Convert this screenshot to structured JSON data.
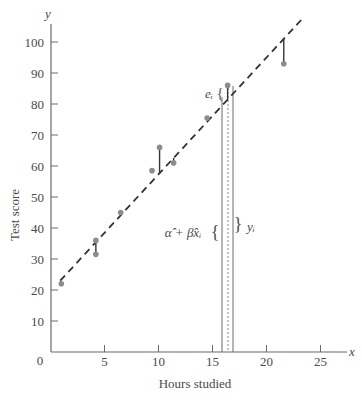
{
  "chart_data": {
    "type": "scatter",
    "title": "",
    "xlabel": "Hours studied",
    "ylabel": "Test score",
    "x_axis_letter": "x",
    "y_axis_letter": "y",
    "xlim": [
      0,
      26.5
    ],
    "ylim": [
      0,
      107
    ],
    "x_ticks": [
      0,
      5,
      10,
      15,
      20,
      25
    ],
    "y_ticks": [
      10,
      20,
      30,
      40,
      50,
      60,
      70,
      80,
      90,
      100
    ],
    "origin_label": "0",
    "grid": false,
    "legend": null,
    "points": [
      {
        "x": 1.0,
        "y": 22.0
      },
      {
        "x": 4.2,
        "y": 36.0
      },
      {
        "x": 4.2,
        "y": 31.5
      },
      {
        "x": 6.5,
        "y": 45.0
      },
      {
        "x": 9.4,
        "y": 58.5
      },
      {
        "x": 10.1,
        "y": 66.0
      },
      {
        "x": 11.4,
        "y": 61.0
      },
      {
        "x": 14.5,
        "y": 75.5
      },
      {
        "x": 16.4,
        "y": 86.0
      },
      {
        "x": 21.6,
        "y": 93.0
      }
    ],
    "regression_line": {
      "style": "dashed",
      "intercept": 19.6,
      "slope": 3.77,
      "x_start": 0.9,
      "x_end": 23.4
    },
    "residuals": [
      {
        "x": 4.2,
        "y_point": 31.5,
        "y_fit": 35.4
      },
      {
        "x": 10.1,
        "y_point": 66.0,
        "y_fit": 57.7
      },
      {
        "x": 11.4,
        "y_point": 61.0,
        "y_fit": 62.6
      },
      {
        "x": 16.4,
        "y_point": 86.0,
        "y_fit": 81.4
      },
      {
        "x": 21.6,
        "y_point": 93.0,
        "y_fit": 101.0
      }
    ],
    "annotations": {
      "highlight_x": 16.4,
      "fitted_label": "α̂ + β̂xᵢ",
      "observed_label": "yᵢ",
      "residual_label": "eᵢ"
    }
  }
}
